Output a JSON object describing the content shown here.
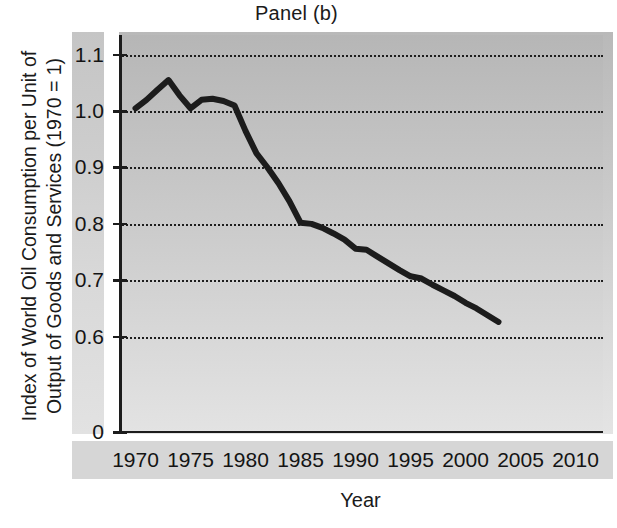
{
  "chart_data": {
    "type": "line",
    "title": "Panel (b)",
    "xlabel": "Year",
    "ylabel": "Index of World Oil Consumption per Unit of Output of Goods and Services (1970 = 1)",
    "ylabel_line1": "Index of World Oil Consumption per Unit of",
    "ylabel_line2": "Output of Goods and Services (1970 = 1)",
    "grid": true,
    "legend": "none",
    "xlim": [
      1968.5,
      2012.5
    ],
    "ylim": [
      0.555,
      1.135
    ],
    "y_axis_has_zero_break": true,
    "x_ticks": [
      1970,
      1975,
      1980,
      1985,
      1990,
      1995,
      2000,
      2005,
      2010
    ],
    "x_tick_labels": [
      "1970",
      "1975",
      "1980",
      "1985",
      "1990",
      "1995",
      "2000",
      "2005",
      "2010"
    ],
    "y_ticks": [
      1.1,
      1.0,
      0.9,
      0.8,
      0.7,
      0.6,
      0
    ],
    "y_tick_labels": [
      "1.1",
      "1.0",
      "0.9",
      "0.8",
      "0.7",
      "0.6",
      "0"
    ],
    "series": [
      {
        "name": "Index of World Oil Consumption per Unit of Output (1970 = 1)",
        "color": "#1c1c1c",
        "line_width": 6,
        "x": [
          1970,
          1971,
          1972,
          1973,
          1974,
          1975,
          1976,
          1977,
          1978,
          1979,
          1980,
          1981,
          1982,
          1983,
          1984,
          1985,
          1986,
          1987,
          1988,
          1989,
          1990,
          1991,
          1992,
          1993,
          1994,
          1995,
          1996,
          1997,
          1998,
          1999,
          2000,
          2001,
          2002,
          2003
        ],
        "y": [
          1.005,
          1.02,
          1.038,
          1.055,
          1.028,
          1.005,
          1.02,
          1.022,
          1.018,
          1.01,
          0.965,
          0.925,
          0.9,
          0.872,
          0.84,
          0.802,
          0.8,
          0.793,
          0.783,
          0.772,
          0.756,
          0.754,
          0.742,
          0.73,
          0.718,
          0.707,
          0.703,
          0.692,
          0.682,
          0.672,
          0.66,
          0.65,
          0.638,
          0.626
        ]
      }
    ],
    "notes": {
      "y_zero_break": "Axis jumps from 0.6 down to 0; the 0 tick sits at the bottom frame line.",
      "data_ends": "Series ends at 2003; the axis continues to 2010."
    }
  },
  "colors": {
    "line": "#1c1c1c",
    "axis": "#1c1c1c",
    "grid": "#1d1d1d",
    "panel_top": "#b6b6b6",
    "panel_bottom": "#e3e3e3",
    "tick_strip": "#d6d6d6",
    "text": "#141414",
    "page_background": "#ffffff"
  }
}
